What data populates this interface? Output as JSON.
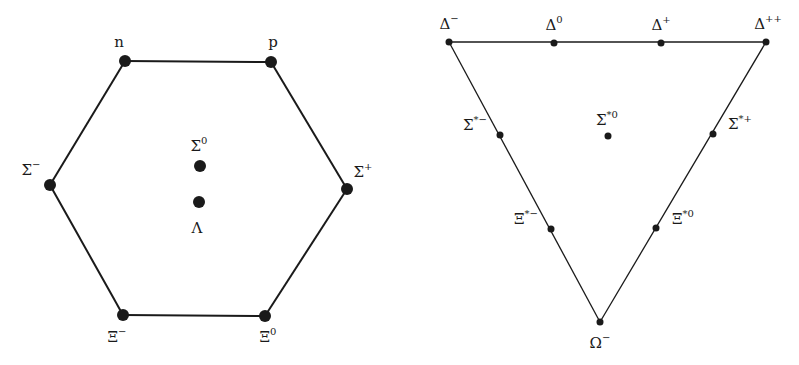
{
  "figure": {
    "left_diagram": {
      "title": "Baryon octet (spin 1/2)",
      "shape": "hexagon",
      "stroke_color": "#1a1a1a",
      "nodes": [
        {
          "id": "n",
          "base": "n",
          "sup": "",
          "x": 125,
          "y": 61,
          "lx": 119,
          "ly": 42
        },
        {
          "id": "p",
          "base": "p",
          "sup": "",
          "x": 271,
          "y": 62,
          "lx": 273,
          "ly": 42
        },
        {
          "id": "sigma-minus",
          "base": "Σ",
          "sup": "−",
          "x": 50,
          "y": 185,
          "lx": 31,
          "ly": 170
        },
        {
          "id": "sigma-plus",
          "base": "Σ",
          "sup": "+",
          "x": 347,
          "y": 189,
          "lx": 363,
          "ly": 172
        },
        {
          "id": "xi-minus",
          "base": "Ξ",
          "sup": "−",
          "x": 123,
          "y": 315,
          "lx": 117,
          "ly": 337
        },
        {
          "id": "xi-zero",
          "base": "Ξ",
          "sup": "0",
          "x": 265,
          "y": 316,
          "lx": 268,
          "ly": 337
        },
        {
          "id": "sigma-zero",
          "base": "Σ",
          "sup": "0",
          "x": 200,
          "y": 166,
          "lx": 199,
          "ly": 146
        },
        {
          "id": "lambda",
          "base": "Λ",
          "sup": "",
          "x": 199,
          "y": 202,
          "lx": 197,
          "ly": 228
        }
      ],
      "edges": [
        [
          "n",
          "p"
        ],
        [
          "p",
          "sigma-plus"
        ],
        [
          "sigma-plus",
          "xi-zero"
        ],
        [
          "xi-zero",
          "xi-minus"
        ],
        [
          "xi-minus",
          "sigma-minus"
        ],
        [
          "sigma-minus",
          "n"
        ]
      ],
      "dot_radius": 6
    },
    "right_diagram": {
      "title": "Baryon decuplet (spin 3/2)",
      "shape": "inverted-triangle",
      "stroke_color": "#1a1a1a",
      "nodes": [
        {
          "id": "delta-minus",
          "base": "Δ",
          "sup": "−",
          "x": 449,
          "y": 42,
          "lx": 449,
          "ly": 24
        },
        {
          "id": "delta-zero",
          "base": "Δ",
          "sup": "0",
          "x": 554,
          "y": 43,
          "lx": 554,
          "ly": 25
        },
        {
          "id": "delta-plus",
          "base": "Δ",
          "sup": "+",
          "x": 661,
          "y": 43,
          "lx": 661,
          "ly": 25
        },
        {
          "id": "delta-plusplus",
          "base": "Δ",
          "sup": "++",
          "x": 766,
          "y": 42,
          "lx": 768,
          "ly": 24
        },
        {
          "id": "sigma-star-minus",
          "base": "Σ",
          "sup": "*−",
          "x": 500,
          "y": 135,
          "lx": 475,
          "ly": 125
        },
        {
          "id": "sigma-star-zero",
          "base": "Σ",
          "sup": "*0",
          "x": 608,
          "y": 136,
          "lx": 607,
          "ly": 120
        },
        {
          "id": "sigma-star-plus",
          "base": "Σ",
          "sup": "*+",
          "x": 713,
          "y": 134,
          "lx": 740,
          "ly": 124
        },
        {
          "id": "xi-star-minus",
          "base": "Ξ",
          "sup": "*−",
          "x": 551,
          "y": 229,
          "lx": 526,
          "ly": 219
        },
        {
          "id": "xi-star-zero",
          "base": "Ξ",
          "sup": "*0",
          "x": 656,
          "y": 228,
          "lx": 683,
          "ly": 219
        },
        {
          "id": "omega-minus",
          "base": "Ω",
          "sup": "−",
          "x": 600,
          "y": 322,
          "lx": 600,
          "ly": 343
        }
      ],
      "edges": [
        [
          "delta-minus",
          "delta-plusplus"
        ],
        [
          "delta-plusplus",
          "omega-minus"
        ],
        [
          "omega-minus",
          "delta-minus"
        ]
      ],
      "dot_radius": 3.5
    }
  }
}
